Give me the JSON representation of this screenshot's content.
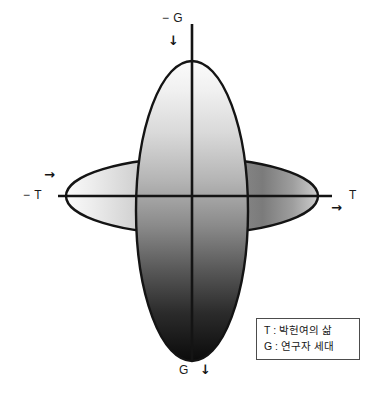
{
  "figure": {
    "kind": "two-axis-ellipse-overlap-diagram",
    "background_color": "#ffffff",
    "stroke_color": "#141414",
    "axes": [
      {
        "id": "vertical",
        "name": "G",
        "positive_label": "G",
        "negative_label": "− G",
        "positive_end": "bottom",
        "negative_end": "top",
        "direction_arrow_glyph": "↓",
        "direction_arrow_name": "arrow-down-icon"
      },
      {
        "id": "horizontal",
        "name": "T",
        "positive_label": "T",
        "negative_label": "− T",
        "positive_end": "right",
        "negative_end": "left",
        "direction_arrow_glyph": "→",
        "direction_arrow_name": "arrow-right-icon"
      }
    ],
    "shapes": [
      {
        "id": "vertical-ellipse",
        "orientation": "vertical",
        "gradient_direction": "top-to-bottom",
        "gradient_from": "#f4f4f4",
        "gradient_to": "#0d0d0d"
      },
      {
        "id": "horizontal-ellipse",
        "orientation": "horizontal",
        "gradient_direction": "left-to-right",
        "gradient_from": "#f2f2f2",
        "gradient_to": "#6e6e6e"
      }
    ]
  },
  "labels": {
    "negative_g": "− G",
    "positive_g": "G",
    "negative_t": "− T",
    "positive_t": "T",
    "arrow_top": "↓",
    "arrow_bottom": "↓",
    "arrow_left": "→",
    "arrow_right": "→"
  },
  "legend": {
    "border_color": "#4c4c4c",
    "rows": [
      {
        "key": "T",
        "text": "T : 박헌여의 삶"
      },
      {
        "key": "G",
        "text": "G : 연구자 세대"
      }
    ]
  }
}
